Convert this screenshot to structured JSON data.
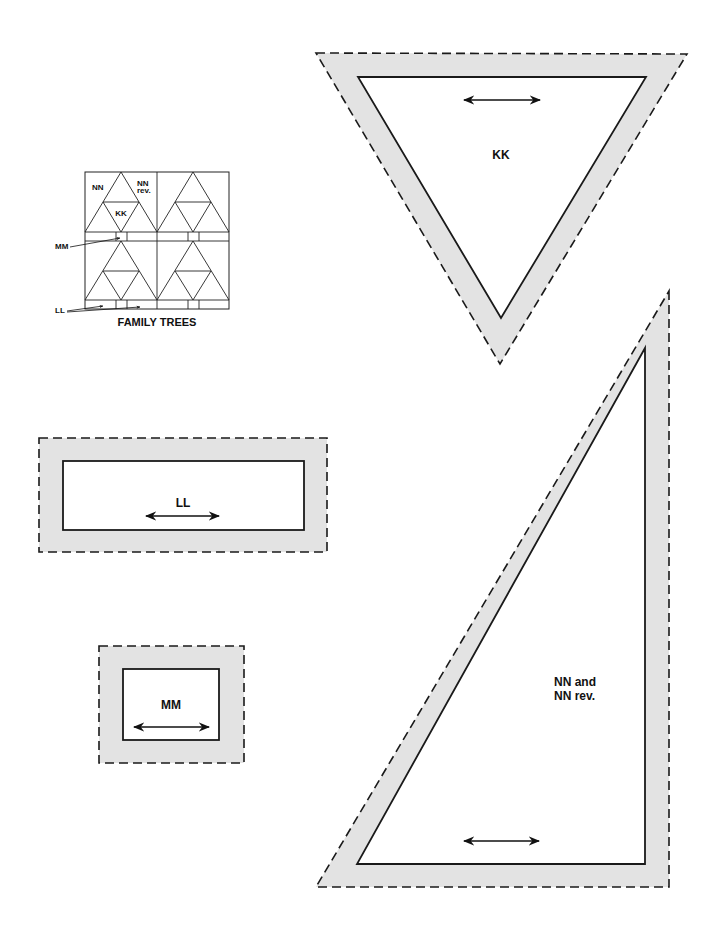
{
  "diagram": {
    "colors": {
      "seam_allowance_fill": "#e3e3e3",
      "line": "#1a1a1a",
      "background": "#ffffff"
    },
    "legend": {
      "title": "FAMILY TREES",
      "labels": {
        "nn": "NN",
        "nn_rev_1": "NN",
        "nn_rev_2": "rev.",
        "kk": "KK",
        "mm": "MM",
        "ll": "LL"
      }
    },
    "templates": [
      {
        "id": "kk",
        "label": "KK",
        "shape": "inverted-triangle",
        "has_grainline_arrow": true
      },
      {
        "id": "ll",
        "label": "LL",
        "shape": "rectangle",
        "has_grainline_arrow": true
      },
      {
        "id": "mm",
        "label": "MM",
        "shape": "rectangle",
        "has_grainline_arrow": true
      },
      {
        "id": "nn",
        "label_line1": "NN and",
        "label_line2": "NN rev.",
        "shape": "right-triangle",
        "has_grainline_arrow": true
      }
    ]
  }
}
